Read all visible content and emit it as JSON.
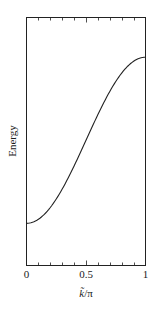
{
  "chart_data": {
    "type": "line",
    "title": "",
    "xlabel": "k̃/π",
    "ylabel": "Energy",
    "xlim": [
      0,
      1
    ],
    "ylim": [
      0,
      1
    ],
    "x_ticks": [
      0,
      0.1,
      0.2,
      0.3,
      0.4,
      0.5,
      0.6,
      0.7,
      0.8,
      0.9,
      1
    ],
    "x_tick_labels": [
      "0",
      "0.5",
      "1"
    ],
    "y_ticks": [],
    "grid": false,
    "legend": null,
    "series": [
      {
        "name": "Energy band",
        "description": "Cosine-shaped dispersion E = E0 - 2t cos(k̃), rising monotonically from a minimum at k̃/π = 0 to a maximum at k̃/π = 1 with an inflection at 0.5",
        "x": [
          0,
          0.1,
          0.2,
          0.3,
          0.4,
          0.5,
          0.6,
          0.7,
          0.8,
          0.9,
          1.0
        ],
        "values": [
          0.17,
          0.185,
          0.225,
          0.29,
          0.37,
          0.5,
          0.63,
          0.71,
          0.775,
          0.815,
          0.84
        ]
      }
    ]
  },
  "axes": {
    "xlabel_main": "k̃",
    "xlabel_suffix": "/π",
    "ylabel": "Energy",
    "tick_labels": {
      "zero": "0",
      "half": "0.5",
      "one": "1"
    }
  }
}
